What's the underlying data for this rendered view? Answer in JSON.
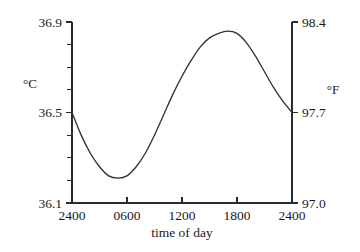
{
  "chart_data": {
    "type": "line",
    "title": "",
    "subtitle": "",
    "xlabel": "time of day",
    "ylabel": "°C",
    "y2label": "°F",
    "grid": false,
    "legend": "none",
    "x": [
      2400,
      100,
      200,
      300,
      400,
      500,
      600,
      700,
      800,
      900,
      1000,
      1100,
      1200,
      1300,
      1400,
      1500,
      1600,
      1700,
      1800,
      1900,
      2000,
      2100,
      2200,
      2300,
      2400
    ],
    "x_hours": [
      0,
      1,
      2,
      3,
      4,
      5,
      6,
      7,
      8,
      9,
      10,
      11,
      12,
      13,
      14,
      15,
      16,
      17,
      18,
      19,
      20,
      21,
      22,
      23,
      24
    ],
    "values_c": [
      36.5,
      36.4,
      36.32,
      36.26,
      36.22,
      36.21,
      36.22,
      36.26,
      36.32,
      36.4,
      36.49,
      36.58,
      36.66,
      36.73,
      36.79,
      36.83,
      36.85,
      36.86,
      36.85,
      36.81,
      36.75,
      36.68,
      36.61,
      36.55,
      36.5
    ],
    "values_f": [
      97.7,
      97.52,
      97.38,
      97.27,
      97.2,
      97.18,
      97.2,
      97.27,
      97.38,
      97.52,
      97.68,
      97.84,
      97.99,
      98.11,
      98.22,
      98.29,
      98.33,
      98.35,
      98.33,
      98.26,
      98.15,
      98.02,
      97.9,
      97.79,
      97.7
    ],
    "xlim": [
      0,
      24
    ],
    "ylim_c": [
      36.1,
      36.9
    ],
    "ylim_f": [
      97.0,
      98.4
    ],
    "x_ticks": [
      0,
      6,
      12,
      18,
      24
    ],
    "x_tick_labels": [
      "2400",
      "0600",
      "1200",
      "1800",
      "2400"
    ],
    "y_left_ticks": [
      36.1,
      36.5,
      36.9
    ],
    "y_left_tick_labels": [
      "36.1",
      "36.5",
      "36.9"
    ],
    "y_left_minor_count": 8,
    "y_right_ticks": [
      97.0,
      97.7,
      98.4
    ],
    "y_right_tick_labels": [
      "97.0",
      "97.7",
      "98.4"
    ],
    "minimum": {
      "time": "0500",
      "value_c": 36.21,
      "value_f": 97.18
    },
    "maximum": {
      "time": "1700",
      "value_c": 36.86,
      "value_f": 98.35
    }
  },
  "axes": {
    "left_unit": "°C",
    "right_unit": "°F",
    "x_title": "time of day"
  },
  "colors": {
    "curve": "#333333",
    "axis": "#2b2b2b",
    "text": "#1a1a1a",
    "background": "#ffffff"
  }
}
